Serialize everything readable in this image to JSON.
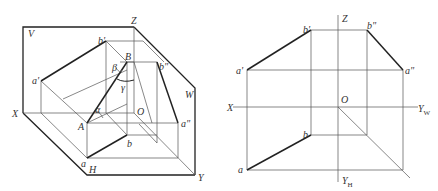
{
  "left_diagram": {
    "planes": {
      "V": "V",
      "W": "W",
      "H": "H"
    },
    "axes": {
      "X": "X",
      "Y": "Y",
      "Z": "Z",
      "O": "O"
    },
    "points": {
      "A": "A",
      "B": "B",
      "a_front": "a'",
      "b_front": "b'",
      "a_side": "a\"",
      "b_side": "b\"",
      "a_top": "a",
      "b_top": "b"
    },
    "angles": {
      "alpha": "α",
      "beta": "β",
      "gamma": "γ"
    }
  },
  "right_diagram": {
    "axes": {
      "X": "X",
      "Z": "Z",
      "O": "O",
      "Y_W": "Y",
      "Y_W_sub": "W",
      "Y_H": "Y",
      "Y_H_sub": "H"
    },
    "points": {
      "a_front": "a'",
      "b_front": "b'",
      "a_side": "a\"",
      "b_side": "b\"",
      "a_top": "a",
      "b_top": "b"
    }
  }
}
